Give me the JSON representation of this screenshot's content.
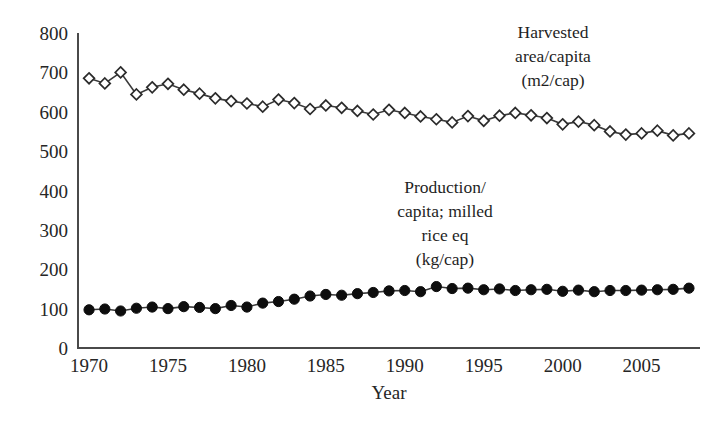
{
  "chart_data": {
    "type": "line",
    "title": "",
    "xlabel": "Year",
    "ylabel": "",
    "xlim": [
      1969.3,
      2008.7
    ],
    "ylim": [
      0,
      800
    ],
    "grid": false,
    "legend_position": "inline-annotations",
    "xticks": [
      1970,
      1975,
      1980,
      1985,
      1990,
      1995,
      2000,
      2005
    ],
    "xtick_labels": [
      "1970",
      "1975",
      "1980",
      "1985",
      "1990",
      "1995",
      "2000",
      "2005"
    ],
    "yticks": [
      0,
      100,
      200,
      300,
      400,
      500,
      600,
      700,
      800
    ],
    "ytick_labels": [
      "0",
      "100",
      "200",
      "300",
      "400",
      "500",
      "600",
      "700",
      "800"
    ],
    "x": [
      1970,
      1971,
      1972,
      1973,
      1974,
      1975,
      1976,
      1977,
      1978,
      1979,
      1980,
      1981,
      1982,
      1983,
      1984,
      1985,
      1986,
      1987,
      1988,
      1989,
      1990,
      1991,
      1992,
      1993,
      1994,
      1995,
      1996,
      1997,
      1998,
      1999,
      2000,
      2001,
      2002,
      2003,
      2004,
      2005,
      2006,
      2007,
      2008
    ],
    "series": [
      {
        "name": "Harvested area/capita (m2/cap)",
        "marker": "diamond-open",
        "values": [
          685,
          672,
          700,
          644,
          662,
          671,
          656,
          646,
          634,
          627,
          621,
          613,
          631,
          622,
          607,
          616,
          610,
          602,
          593,
          605,
          597,
          588,
          581,
          573,
          589,
          577,
          590,
          597,
          591,
          584,
          568,
          575,
          566,
          550,
          542,
          545,
          552,
          540,
          545
        ]
      },
      {
        "name": "Production/capita; milled rice eq (kg/cap)",
        "marker": "circle-filled",
        "values": [
          97,
          99,
          94,
          101,
          104,
          100,
          105,
          103,
          100,
          108,
          104,
          114,
          118,
          124,
          132,
          136,
          134,
          138,
          141,
          145,
          146,
          143,
          156,
          151,
          152,
          148,
          150,
          146,
          148,
          149,
          144,
          147,
          143,
          146,
          146,
          147,
          148,
          149,
          152
        ]
      }
    ],
    "annotations": [
      {
        "name": "harvested-area-label",
        "lines": [
          "Harvested",
          "area/capita",
          "(m2/cap)"
        ],
        "x": 553,
        "y": 38
      },
      {
        "name": "production-label",
        "lines": [
          "Production/",
          "capita; milled",
          "rice eq",
          "(kg/cap)"
        ],
        "x": 445,
        "y": 193
      }
    ],
    "colors": {
      "axis": "#4a4a4a",
      "line": "#3a3a3a",
      "diamond_fill": "#ffffff",
      "diamond_stroke": "#2b2b2b",
      "circle_fill": "#0d0d0d",
      "text": "#262626",
      "background": "#ffffff"
    },
    "plot_geometry": {
      "left": 78,
      "right": 700,
      "top": 33,
      "bottom": 348
    }
  }
}
